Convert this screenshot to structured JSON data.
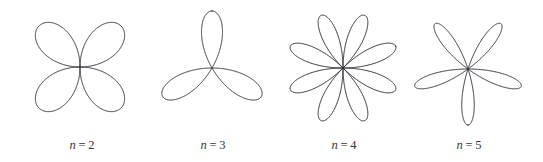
{
  "figure": {
    "background_color": "#ffffff",
    "stroke_color": "#2b2b33",
    "label_color": "#33333a",
    "width": 543,
    "height": 162
  },
  "chart_data": {
    "type": "line",
    "plot_kind": "polar-rose",
    "title": "",
    "subtitle": "",
    "xlabel": "",
    "ylabel": "",
    "grid": false,
    "axes_visible": false,
    "legend": "none",
    "equation": "r = cos(nθ)",
    "series": [
      {
        "name": "n = 2",
        "n": 2,
        "petals": 4,
        "petal_axis_angles_deg": [
          45,
          135,
          225,
          315
        ],
        "center_px": [
          80,
          67
        ],
        "radius_px": 58,
        "petal_half_width_deg": 45,
        "rotation_deg": 45,
        "values": [
          1,
          0,
          1,
          0,
          1,
          0,
          1,
          0
        ]
      },
      {
        "name": "n = 3",
        "n": 3,
        "petals": 3,
        "petal_axis_angles_deg": [
          90,
          210,
          330
        ],
        "center_px": [
          212,
          68
        ],
        "radius_px": 57,
        "petal_half_width_deg": 30,
        "rotation_deg": 90,
        "values": [
          1,
          1,
          1
        ]
      },
      {
        "name": "n = 4",
        "n": 4,
        "petals": 8,
        "petal_axis_angles_deg": [
          67.5,
          112.5,
          157.5,
          202.5,
          247.5,
          292.5,
          337.5,
          22.5
        ],
        "center_px": [
          343,
          68
        ],
        "radius_px": 57,
        "petal_half_width_deg": 22.5,
        "rotation_deg": 22.5,
        "values": [
          1,
          1,
          1,
          1,
          1,
          1,
          1,
          1
        ]
      },
      {
        "name": "n = 5",
        "n": 5,
        "petals": 5,
        "petal_axis_angles_deg": [
          270,
          342,
          54,
          126,
          198
        ],
        "center_px": [
          468,
          69
        ],
        "radius_px": 56,
        "petal_half_width_deg": 18,
        "rotation_deg": 270,
        "values": [
          1,
          1,
          1,
          1,
          1
        ]
      }
    ]
  },
  "panels": [
    {
      "id": "panel-n2",
      "label_var": "n",
      "label_eq": "=",
      "label_num": "2",
      "label_text": "n = 2",
      "center_x": 80,
      "center_y": 67,
      "radius": 58,
      "n": 2,
      "rotation_deg": 45,
      "caption_left": 22,
      "caption_top": 138
    },
    {
      "id": "panel-n3",
      "label_var": "n",
      "label_eq": "=",
      "label_num": "3",
      "label_text": "n = 3",
      "center_x": 212,
      "center_y": 68,
      "radius": 57,
      "n": 3,
      "rotation_deg": 90,
      "caption_left": 153,
      "caption_top": 138
    },
    {
      "id": "panel-n4",
      "label_var": "n",
      "label_eq": "=",
      "label_num": "4",
      "label_text": "n = 4",
      "center_x": 343,
      "center_y": 68,
      "radius": 57,
      "n": 4,
      "rotation_deg": 22.5,
      "caption_left": 284,
      "caption_top": 138
    },
    {
      "id": "panel-n5",
      "label_var": "n",
      "label_eq": "=",
      "label_num": "5",
      "label_text": "n = 5",
      "center_x": 468,
      "center_y": 69,
      "radius": 56,
      "n": 5,
      "rotation_deg": 270,
      "caption_left": 409,
      "caption_top": 138
    }
  ]
}
